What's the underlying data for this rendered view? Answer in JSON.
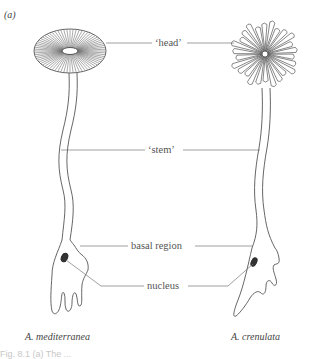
{
  "figure": {
    "panel_label": "(a)",
    "labels": {
      "head": "‘head’",
      "stem": "‘stem’",
      "basal_region": "basal region",
      "nucleus": "nucleus"
    },
    "species": {
      "left": "A. mediterranea",
      "right": "A. crenulata"
    },
    "caption_partial": "Fig. 8.1  (a) The ..."
  }
}
